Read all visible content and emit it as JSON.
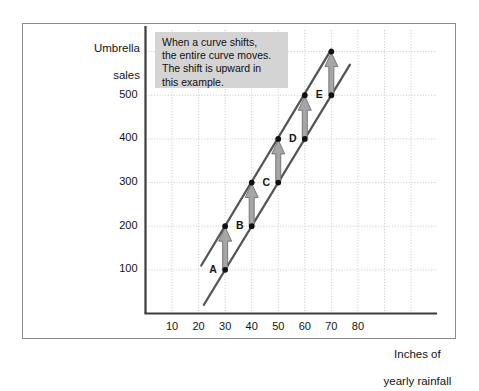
{
  "figure": {
    "annotation": {
      "lines": [
        "When a curve shifts,",
        "the entire curve moves.",
        "The shift is upward in",
        "this example."
      ],
      "text": "When a curve shifts, the entire curve moves. The shift is upward in this example.",
      "background_color": "#d4d4d4"
    },
    "colors": {
      "line": "#555555",
      "arrow": "#a6a6a6",
      "arrow_outline": "#6e6e6e",
      "grid": "#c8c8c8",
      "axis": "#3c3c3c",
      "point": "#111111",
      "frame": "#8b8b8b"
    }
  },
  "chart_data": {
    "type": "line",
    "title": "",
    "xlabel": "Inches of yearly rainfall",
    "ylabel": "Umbrella sales",
    "xlabel_lines": [
      "Inches of",
      "yearly rainfall"
    ],
    "ylabel_lines": [
      "Umbrella",
      "sales"
    ],
    "xlim": [
      0,
      100
    ],
    "ylim": [
      0,
      650
    ],
    "xticks": [
      10,
      20,
      30,
      40,
      50,
      60,
      70,
      80
    ],
    "yticks": [
      100,
      200,
      300,
      400,
      500
    ],
    "grid": true,
    "legend": "none",
    "series": [
      {
        "name": "original curve",
        "role": "original",
        "points": [
          {
            "x": 30,
            "y": 100,
            "label": "A"
          },
          {
            "x": 40,
            "y": 200,
            "label": "B"
          },
          {
            "x": 50,
            "y": 300,
            "label": "C"
          },
          {
            "x": 60,
            "y": 400,
            "label": "D"
          },
          {
            "x": 70,
            "y": 500,
            "label": "E"
          }
        ],
        "line_from": {
          "x": 22,
          "y": 20
        },
        "line_to": {
          "x": 77,
          "y": 570
        }
      },
      {
        "name": "shifted curve",
        "role": "shifted",
        "points": [
          {
            "x": 30,
            "y": 200
          },
          {
            "x": 40,
            "y": 300
          },
          {
            "x": 50,
            "y": 400
          },
          {
            "x": 60,
            "y": 500
          },
          {
            "x": 70,
            "y": 600
          }
        ],
        "line_from": {
          "x": 21,
          "y": 110
        },
        "line_to": {
          "x": 70,
          "y": 605
        }
      }
    ],
    "shift_arrows": [
      {
        "x": 30,
        "y_from": 100,
        "y_to": 200
      },
      {
        "x": 40,
        "y_from": 200,
        "y_to": 300
      },
      {
        "x": 50,
        "y_from": 300,
        "y_to": 400
      },
      {
        "x": 60,
        "y_from": 400,
        "y_to": 500
      },
      {
        "x": 70,
        "y_from": 500,
        "y_to": 600
      }
    ],
    "annotation_note": "When a curve shifts, the entire curve moves. The shift is upward in this example."
  }
}
